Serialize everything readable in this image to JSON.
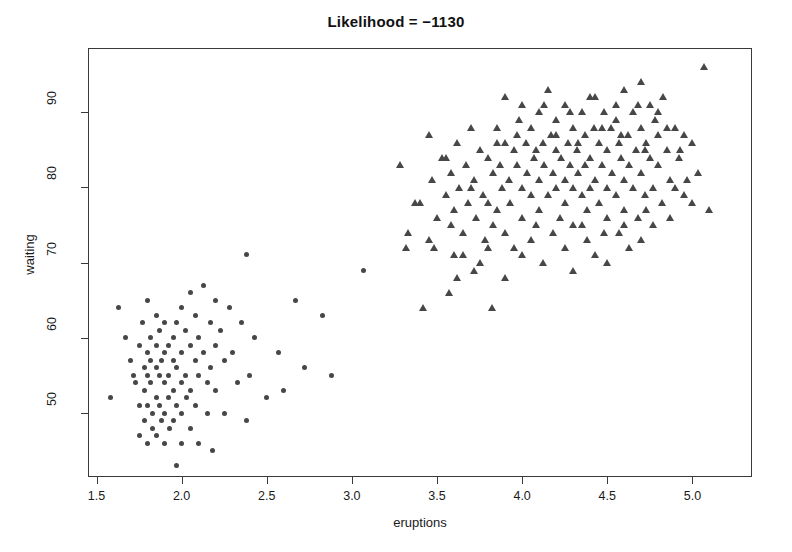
{
  "chart_data": {
    "type": "scatter",
    "title": "Likelihood = −1130",
    "xlabel": "eruptions",
    "ylabel": "waiting",
    "xlim": [
      1.45,
      5.35
    ],
    "ylim": [
      41.5,
      98.5
    ],
    "xticks": [
      1.5,
      2.0,
      2.5,
      3.0,
      3.5,
      4.0,
      4.5,
      5.0
    ],
    "xtick_labels": [
      "1.5",
      "2.0",
      "2.5",
      "3.0",
      "3.5",
      "4.0",
      "4.5",
      "5.0"
    ],
    "yticks": [
      50,
      60,
      70,
      80,
      90
    ],
    "ytick_labels": [
      "50",
      "60",
      "70",
      "80",
      "90"
    ],
    "grid": false,
    "legend": "none",
    "marker_color": "#474747",
    "box_color": "#3a3a3a",
    "background": "#ffffff",
    "series": [
      {
        "name": "cluster-1-short-eruptions",
        "marker": "circle",
        "color": "#474747",
        "n": 97,
        "points": [
          [
            1.58,
            52
          ],
          [
            1.63,
            64
          ],
          [
            1.67,
            60
          ],
          [
            1.7,
            57
          ],
          [
            1.72,
            55
          ],
          [
            1.73,
            54
          ],
          [
            1.75,
            59
          ],
          [
            1.75,
            51
          ],
          [
            1.75,
            47
          ],
          [
            1.77,
            62
          ],
          [
            1.78,
            56
          ],
          [
            1.78,
            53
          ],
          [
            1.78,
            49
          ],
          [
            1.8,
            65
          ],
          [
            1.8,
            58
          ],
          [
            1.8,
            55
          ],
          [
            1.8,
            51
          ],
          [
            1.8,
            46
          ],
          [
            1.82,
            60
          ],
          [
            1.82,
            57
          ],
          [
            1.82,
            54
          ],
          [
            1.83,
            50
          ],
          [
            1.83,
            48
          ],
          [
            1.85,
            63
          ],
          [
            1.85,
            59
          ],
          [
            1.85,
            56
          ],
          [
            1.85,
            52
          ],
          [
            1.85,
            47
          ],
          [
            1.87,
            61
          ],
          [
            1.87,
            55
          ],
          [
            1.87,
            51
          ],
          [
            1.88,
            57
          ],
          [
            1.88,
            49
          ],
          [
            1.9,
            62
          ],
          [
            1.9,
            58
          ],
          [
            1.9,
            54
          ],
          [
            1.9,
            50
          ],
          [
            1.9,
            46
          ],
          [
            1.92,
            59
          ],
          [
            1.92,
            55
          ],
          [
            1.92,
            52
          ],
          [
            1.93,
            48
          ],
          [
            1.95,
            60
          ],
          [
            1.95,
            57
          ],
          [
            1.95,
            53
          ],
          [
            1.95,
            49
          ],
          [
            1.97,
            62
          ],
          [
            1.97,
            56
          ],
          [
            1.97,
            51
          ],
          [
            1.97,
            43
          ],
          [
            2.0,
            64
          ],
          [
            2.0,
            58
          ],
          [
            2.0,
            54
          ],
          [
            2.0,
            50
          ],
          [
            2.0,
            46
          ],
          [
            2.02,
            61
          ],
          [
            2.02,
            55
          ],
          [
            2.03,
            52
          ],
          [
            2.05,
            66
          ],
          [
            2.05,
            59
          ],
          [
            2.05,
            53
          ],
          [
            2.05,
            48
          ],
          [
            2.08,
            63
          ],
          [
            2.08,
            57
          ],
          [
            2.08,
            51
          ],
          [
            2.1,
            60
          ],
          [
            2.1,
            55
          ],
          [
            2.1,
            46
          ],
          [
            2.13,
            67
          ],
          [
            2.13,
            58
          ],
          [
            2.15,
            54
          ],
          [
            2.15,
            50
          ],
          [
            2.17,
            62
          ],
          [
            2.17,
            56
          ],
          [
            2.18,
            45
          ],
          [
            2.2,
            65
          ],
          [
            2.2,
            59
          ],
          [
            2.2,
            53
          ],
          [
            2.23,
            61
          ],
          [
            2.25,
            57
          ],
          [
            2.25,
            50
          ],
          [
            2.28,
            64
          ],
          [
            2.3,
            58
          ],
          [
            2.33,
            54
          ],
          [
            2.35,
            62
          ],
          [
            2.38,
            71
          ],
          [
            2.38,
            49
          ],
          [
            2.4,
            55
          ],
          [
            2.43,
            60
          ],
          [
            2.5,
            52
          ],
          [
            2.57,
            58
          ],
          [
            2.6,
            53
          ],
          [
            2.67,
            65
          ],
          [
            2.72,
            56
          ],
          [
            2.83,
            63
          ],
          [
            2.88,
            55
          ],
          [
            3.07,
            69
          ]
        ]
      },
      {
        "name": "cluster-2-long-eruptions",
        "marker": "triangle",
        "color": "#474747",
        "n": 175,
        "points": [
          [
            3.28,
            83
          ],
          [
            3.33,
            74
          ],
          [
            3.37,
            78
          ],
          [
            3.42,
            64
          ],
          [
            3.45,
            87
          ],
          [
            3.47,
            81
          ],
          [
            3.48,
            72
          ],
          [
            3.5,
            76
          ],
          [
            3.53,
            84
          ],
          [
            3.55,
            79
          ],
          [
            3.57,
            66
          ],
          [
            3.58,
            82
          ],
          [
            3.6,
            77
          ],
          [
            3.6,
            71
          ],
          [
            3.62,
            86
          ],
          [
            3.63,
            80
          ],
          [
            3.65,
            74
          ],
          [
            3.67,
            83
          ],
          [
            3.68,
            78
          ],
          [
            3.7,
            88
          ],
          [
            3.72,
            81
          ],
          [
            3.73,
            76
          ],
          [
            3.75,
            85
          ],
          [
            3.77,
            79
          ],
          [
            3.78,
            73
          ],
          [
            3.8,
            84
          ],
          [
            3.8,
            78
          ],
          [
            3.82,
            64
          ],
          [
            3.83,
            82
          ],
          [
            3.85,
            88
          ],
          [
            3.85,
            77
          ],
          [
            3.87,
            83
          ],
          [
            3.88,
            80
          ],
          [
            3.9,
            92
          ],
          [
            3.9,
            86
          ],
          [
            3.9,
            74
          ],
          [
            3.92,
            81
          ],
          [
            3.93,
            78
          ],
          [
            3.95,
            85
          ],
          [
            3.95,
            72
          ],
          [
            3.97,
            83
          ],
          [
            3.98,
            89
          ],
          [
            4.0,
            91
          ],
          [
            4.0,
            80
          ],
          [
            4.0,
            76
          ],
          [
            4.02,
            86
          ],
          [
            4.03,
            82
          ],
          [
            4.05,
            88
          ],
          [
            4.05,
            79
          ],
          [
            4.07,
            84
          ],
          [
            4.08,
            75
          ],
          [
            4.1,
            90
          ],
          [
            4.1,
            81
          ],
          [
            4.1,
            77
          ],
          [
            4.12,
            86
          ],
          [
            4.13,
            83
          ],
          [
            4.15,
            93
          ],
          [
            4.15,
            79
          ],
          [
            4.17,
            87
          ],
          [
            4.18,
            82
          ],
          [
            4.2,
            89
          ],
          [
            4.2,
            85
          ],
          [
            4.2,
            80
          ],
          [
            4.22,
            76
          ],
          [
            4.23,
            84
          ],
          [
            4.25,
            91
          ],
          [
            4.25,
            81
          ],
          [
            4.25,
            78
          ],
          [
            4.27,
            86
          ],
          [
            4.28,
            83
          ],
          [
            4.3,
            88
          ],
          [
            4.3,
            80
          ],
          [
            4.3,
            75
          ],
          [
            4.32,
            85
          ],
          [
            4.33,
            82
          ],
          [
            4.35,
            90
          ],
          [
            4.35,
            79
          ],
          [
            4.37,
            87
          ],
          [
            4.37,
            83
          ],
          [
            4.38,
            77
          ],
          [
            4.4,
            92
          ],
          [
            4.4,
            84
          ],
          [
            4.4,
            80
          ],
          [
            4.42,
            88
          ],
          [
            4.43,
            81
          ],
          [
            4.45,
            86
          ],
          [
            4.45,
            78
          ],
          [
            4.47,
            83
          ],
          [
            4.48,
            90
          ],
          [
            4.5,
            85
          ],
          [
            4.5,
            80
          ],
          [
            4.5,
            76
          ],
          [
            4.52,
            88
          ],
          [
            4.53,
            82
          ],
          [
            4.55,
            91
          ],
          [
            4.55,
            79
          ],
          [
            4.57,
            86
          ],
          [
            4.58,
            84
          ],
          [
            4.6,
            93
          ],
          [
            4.6,
            81
          ],
          [
            4.6,
            77
          ],
          [
            4.62,
            87
          ],
          [
            4.63,
            83
          ],
          [
            4.65,
            90
          ],
          [
            4.65,
            80
          ],
          [
            4.67,
            85
          ],
          [
            4.68,
            76
          ],
          [
            4.7,
            94
          ],
          [
            4.7,
            88
          ],
          [
            4.7,
            82
          ],
          [
            4.72,
            79
          ],
          [
            4.73,
            86
          ],
          [
            4.75,
            91
          ],
          [
            4.75,
            84
          ],
          [
            4.77,
            80
          ],
          [
            4.78,
            89
          ],
          [
            4.8,
            87
          ],
          [
            4.8,
            83
          ],
          [
            4.82,
            78
          ],
          [
            4.83,
            92
          ],
          [
            4.85,
            85
          ],
          [
            4.87,
            81
          ],
          [
            4.9,
            88
          ],
          [
            4.92,
            84
          ],
          [
            4.95,
            79
          ],
          [
            5.0,
            86
          ],
          [
            5.03,
            82
          ],
          [
            5.07,
            96
          ],
          [
            5.1,
            77
          ],
          [
            3.32,
            72
          ],
          [
            3.4,
            78
          ],
          [
            3.55,
            84
          ],
          [
            3.62,
            68
          ],
          [
            3.7,
            80
          ],
          [
            3.75,
            70
          ],
          [
            3.83,
            75
          ],
          [
            3.9,
            68
          ],
          [
            4.0,
            71
          ],
          [
            4.05,
            73
          ],
          [
            4.12,
            70
          ],
          [
            4.18,
            74
          ],
          [
            4.25,
            72
          ],
          [
            4.3,
            69
          ],
          [
            4.38,
            73
          ],
          [
            4.43,
            71
          ],
          [
            4.5,
            70
          ],
          [
            4.57,
            74
          ],
          [
            4.63,
            72
          ],
          [
            4.7,
            73
          ],
          [
            4.77,
            75
          ],
          [
            3.85,
            86
          ],
          [
            3.97,
            87
          ],
          [
            4.08,
            85
          ],
          [
            4.2,
            87
          ],
          [
            4.33,
            86
          ],
          [
            4.47,
            88
          ],
          [
            4.58,
            87
          ],
          [
            4.72,
            85
          ],
          [
            4.85,
            88
          ],
          [
            4.13,
            91
          ],
          [
            4.28,
            90
          ],
          [
            4.43,
            92
          ],
          [
            4.55,
            89
          ],
          [
            4.68,
            91
          ],
          [
            4.8,
            90
          ],
          [
            3.45,
            73
          ],
          [
            3.58,
            75
          ],
          [
            3.65,
            71
          ],
          [
            3.72,
            69
          ],
          [
            3.8,
            72
          ],
          [
            4.35,
            75
          ],
          [
            4.48,
            74
          ],
          [
            4.6,
            75
          ],
          [
            4.73,
            77
          ],
          [
            4.87,
            76
          ],
          [
            4.93,
            85
          ],
          [
            4.97,
            81
          ],
          [
            5.0,
            78
          ],
          [
            4.9,
            80
          ],
          [
            4.95,
            87
          ]
        ]
      }
    ]
  }
}
